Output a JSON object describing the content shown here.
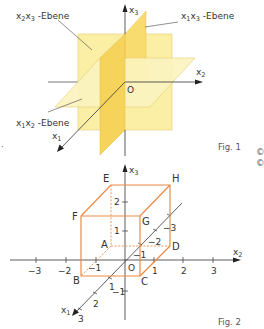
{
  "fig1": {
    "caption": "Fig. 1",
    "axes": {
      "x1": {
        "base": "x",
        "sub": "1"
      },
      "x2": {
        "base": "x",
        "sub": "2"
      },
      "x3": {
        "base": "x",
        "sub": "3"
      }
    },
    "origin": "O",
    "planes": {
      "x2x3": {
        "a": "x",
        "a_sub": "2",
        "b": "x",
        "b_sub": "3",
        "suffix": " -Ebene"
      },
      "x1x3": {
        "a": "x",
        "a_sub": "1",
        "b": "x",
        "b_sub": "3",
        "suffix": " -Ebene"
      },
      "x1x2": {
        "a": "x",
        "a_sub": "1",
        "b": "x",
        "b_sub": "2",
        "suffix": " -Ebene"
      }
    },
    "colors": {
      "plane_light": "#fbf0a8",
      "plane_mid": "#fae79a",
      "plane_dark": "#f5d35a",
      "axis": "#333333"
    }
  },
  "fig2": {
    "caption": "Fig. 2",
    "axes": {
      "x1": {
        "base": "x",
        "sub": "1"
      },
      "x2": {
        "base": "x",
        "sub": "2"
      },
      "x3": {
        "base": "x",
        "sub": "3"
      }
    },
    "origin": "O",
    "x2_ticks": [
      "−3",
      "−2",
      "−1",
      "1",
      "2",
      "3"
    ],
    "x3_ticks": [
      "2",
      "1",
      "−1"
    ],
    "x1_ticks": [
      "1",
      "2",
      "3",
      "−1",
      "−2",
      "−3"
    ],
    "vertices": {
      "A": "A",
      "B": "B",
      "C": "C",
      "D": "D",
      "E": "E",
      "F": "F",
      "G": "G",
      "H": "H"
    },
    "colors": {
      "cube": "#ee8a45",
      "axis": "#333333"
    }
  },
  "margin_mark": "©"
}
